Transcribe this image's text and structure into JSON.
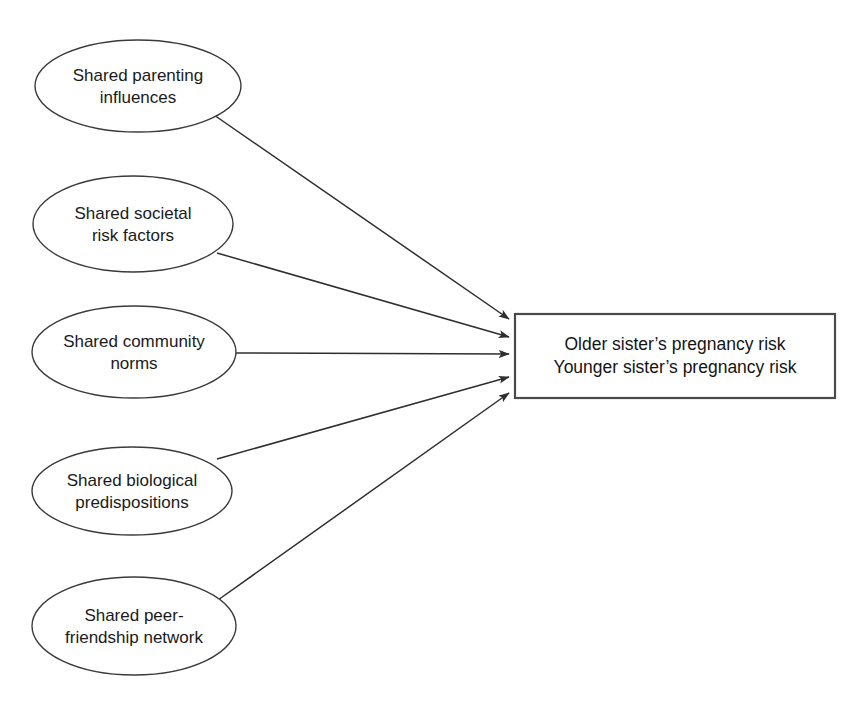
{
  "diagram": {
    "type": "influence-diagram",
    "background_color": "#ffffff",
    "stroke_color": "#2e2e2e",
    "text_color": "#1a1a1a",
    "predictors": [
      {
        "id": "shared-parenting-influences",
        "lines": [
          "Shared parenting",
          "influences"
        ],
        "cx": 138,
        "cy": 86,
        "rx": 103,
        "ry": 46
      },
      {
        "id": "shared-societal-risk-factors",
        "lines": [
          "Shared societal",
          "risk factors"
        ],
        "cx": 133,
        "cy": 224,
        "rx": 100,
        "ry": 48
      },
      {
        "id": "shared-community-norms",
        "lines": [
          "Shared community",
          "norms"
        ],
        "cx": 134,
        "cy": 352,
        "rx": 102,
        "ry": 46
      },
      {
        "id": "shared-biological-predispositions",
        "lines": [
          "Shared biological",
          "predispositions"
        ],
        "cx": 132,
        "cy": 491,
        "rx": 100,
        "ry": 44
      },
      {
        "id": "shared-peer-friendship-network",
        "lines": [
          "Shared peer-",
          "friendship network"
        ],
        "cx": 134,
        "cy": 626,
        "rx": 102,
        "ry": 49
      }
    ],
    "outcome": {
      "id": "sisters-pregnancy-risk",
      "x": 515,
      "y": 314,
      "width": 320,
      "height": 84,
      "lines": [
        "Older sister’s pregnancy risk",
        "Younger sister’s pregnancy risk"
      ]
    },
    "arrows": [
      {
        "id": "arrow-parenting-to-outcome",
        "from": "shared-parenting-influences",
        "to": "sisters-pregnancy-risk",
        "x1": 214,
        "y1": 115,
        "x2": 509,
        "y2": 319
      },
      {
        "id": "arrow-societal-to-outcome",
        "from": "shared-societal-risk-factors",
        "to": "sisters-pregnancy-risk",
        "x1": 217,
        "y1": 253,
        "x2": 509,
        "y2": 337
      },
      {
        "id": "arrow-community-to-outcome",
        "from": "shared-community-norms",
        "to": "sisters-pregnancy-risk",
        "x1": 236,
        "y1": 353,
        "x2": 509,
        "y2": 354
      },
      {
        "id": "arrow-biological-to-outcome",
        "from": "shared-biological-predispositions",
        "to": "sisters-pregnancy-risk",
        "x1": 217,
        "y1": 459,
        "x2": 509,
        "y2": 377
      },
      {
        "id": "arrow-peer-network-to-outcome",
        "from": "shared-peer-friendship-network",
        "to": "sisters-pregnancy-risk",
        "x1": 218,
        "y1": 600,
        "x2": 509,
        "y2": 393
      }
    ]
  }
}
